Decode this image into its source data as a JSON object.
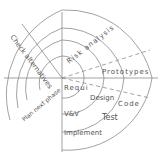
{
  "diagram": {
    "type": "spiral-model-sketch",
    "stroke_color": "#7a7a7a",
    "text_color": "#555555",
    "labels": {
      "check_alternatives": "Check alternatives",
      "risk_analysis": "Risk analysis",
      "prototypes": "Prototypes",
      "requirements": "Requi",
      "design": "Design",
      "code": "Code",
      "vv": "V&V",
      "test": "Test",
      "implement": "Implement",
      "plan_next_phase": "Plan next phase"
    }
  }
}
